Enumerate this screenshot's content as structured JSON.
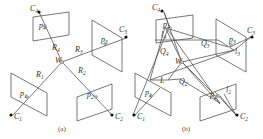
{
  "figure": {
    "panel_a": {
      "caption": "(a)",
      "center": {
        "label": "W"
      },
      "cameras": [
        {
          "label": "C",
          "sub": "1",
          "point": "p",
          "point_sub": "1",
          "ray": "R",
          "ray_sub": "1"
        },
        {
          "label": "C",
          "sub": "2",
          "point": "p",
          "point_sub": "2",
          "ray": "R",
          "ray_sub": "2"
        },
        {
          "label": "C",
          "sub": "3",
          "point": "p",
          "point_sub": "3",
          "ray": "R",
          "ray_sub": "3"
        },
        {
          "label": "C",
          "sub": "4",
          "point": "p",
          "point_sub": "4",
          "ray": "R",
          "ray_sub": "4"
        }
      ]
    },
    "panel_b": {
      "caption": "(b)",
      "center": {
        "label": "W"
      },
      "line_label": "L",
      "cameras": [
        {
          "label": "C",
          "sub": "1",
          "point": "p",
          "point_sub": "1"
        },
        {
          "label": "C",
          "sub": "2",
          "point": "p",
          "point_sub": "2",
          "line": "l",
          "line_sub": "2",
          "plane": "Q",
          "plane_sub": "2"
        },
        {
          "label": "C",
          "sub": "3",
          "point": "p",
          "point_sub": "3",
          "line": "l",
          "line_sub": "3",
          "plane": "Q",
          "plane_sub": "3"
        },
        {
          "label": "C",
          "sub": "4",
          "point": "p",
          "point_sub": "4",
          "line": "l",
          "line_sub": "4",
          "plane": "Q",
          "plane_sub": "4"
        }
      ]
    }
  }
}
